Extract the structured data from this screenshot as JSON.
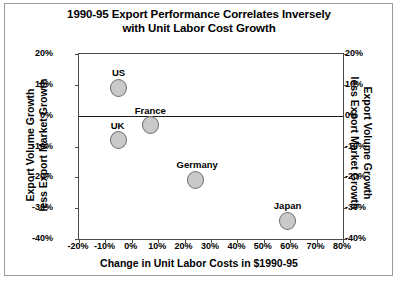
{
  "chart_data": {
    "type": "scatter",
    "title": "1990-95 Export Performance Correlates Inversely with Unit Labor Cost Growth",
    "title_lines": [
      "1990-95 Export Performance Correlates Inversely",
      "with Unit Labor Cost Growth"
    ],
    "xlabel": "Change in Unit Labor Costs in $1990-95",
    "ylabel": "Export Volume Growth less Export Market Growth",
    "ylabel_lines": [
      "Export Volume Growth",
      "less Export Market Growth"
    ],
    "ylabel_right": "Export Volume Growth less Export Market Growth",
    "ylabel_right_lines": [
      "Export Volume Growth",
      "less Export Market Growth"
    ],
    "xlim": [
      -20,
      80
    ],
    "ylim": [
      -40,
      20
    ],
    "xticks": [
      "-20%",
      "-10%",
      "0%",
      "10%",
      "20%",
      "30%",
      "40%",
      "50%",
      "60%",
      "70%",
      "80%"
    ],
    "xtick_values": [
      -20,
      -10,
      0,
      10,
      20,
      30,
      40,
      50,
      60,
      70,
      80
    ],
    "yticks": [
      "20%",
      "10%",
      "0%",
      "-10%",
      "-20%",
      "-30%",
      "-40%"
    ],
    "ytick_values": [
      20,
      10,
      0,
      -10,
      -20,
      -30,
      -40
    ],
    "grid": false,
    "legend": "none",
    "zero_line": 0,
    "marker_color": "#c9c9c9",
    "marker_edge_color": "#6e6e6e",
    "points": [
      {
        "label": "US",
        "x": -5,
        "y": 9,
        "label_dx": 0,
        "label_dy": -15
      },
      {
        "label": "France",
        "x": 7,
        "y": -3,
        "label_dx": 0,
        "label_dy": -14
      },
      {
        "label": "UK",
        "x": -5,
        "y": -8,
        "label_dx": -1,
        "label_dy": -14
      },
      {
        "label": "Germany",
        "x": 24,
        "y": -21,
        "label_dx": 2,
        "label_dy": -15
      },
      {
        "label": "Japan",
        "x": 59,
        "y": -34,
        "label_dx": 0,
        "label_dy": -15
      }
    ]
  }
}
